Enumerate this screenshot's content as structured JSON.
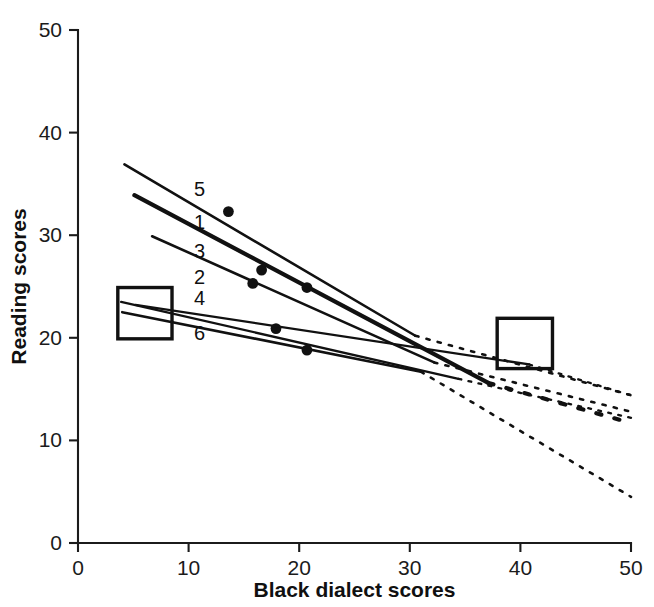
{
  "chart_data": {
    "type": "line",
    "title": "",
    "xlabel": "Black dialect scores",
    "ylabel": "Reading scores",
    "xlim": [
      0,
      50
    ],
    "ylim": [
      0,
      50
    ],
    "xticks": [
      0,
      10,
      20,
      30,
      40,
      50
    ],
    "yticks": [
      0,
      10,
      20,
      30,
      40,
      50
    ],
    "xtick_labels": [
      "0",
      "10",
      "20",
      "30",
      "40",
      "50"
    ],
    "ytick_labels": [
      "0",
      "10",
      "20",
      "30",
      "40",
      "50"
    ],
    "grid": false,
    "legend_position": "inline-labels",
    "annotations": [
      {
        "name": "left-highlight-box",
        "x0": 3.6,
        "y0": 19.9,
        "x1": 8.5,
        "y1": 24.9
      },
      {
        "name": "right-highlight-box",
        "x0": 37.9,
        "y0": 17.0,
        "x1": 42.9,
        "y1": 21.9
      }
    ],
    "series": [
      {
        "name": "5",
        "label": "5",
        "label_x": 11.0,
        "label_y": 34.5,
        "solid": {
          "x": [
            4.2,
            30.5
          ],
          "y": [
            36.9,
            20.2
          ]
        },
        "dotted": {
          "x": [
            30.5,
            50.0
          ],
          "y": [
            20.2,
            14.4
          ]
        },
        "points": [
          {
            "x": 13.6,
            "y": 32.3
          }
        ]
      },
      {
        "name": "1",
        "label": "1",
        "label_x": 11.0,
        "label_y": 31.3,
        "solid": {
          "x": [
            5.1,
            37.1
          ],
          "y": [
            33.9,
            15.6
          ]
        },
        "dotted": {
          "x": [
            37.1,
            50.0
          ],
          "y": [
            15.6,
            11.7
          ]
        },
        "points": [
          {
            "x": 16.6,
            "y": 26.6
          },
          {
            "x": 20.7,
            "y": 24.9
          }
        ]
      },
      {
        "name": "3",
        "label": "3",
        "label_x": 11.0,
        "label_y": 28.5,
        "solid": {
          "x": [
            6.7,
            32.2
          ],
          "y": [
            29.9,
            17.6
          ]
        },
        "dotted": {
          "x": [
            32.2,
            50.0
          ],
          "y": [
            17.6,
            12.8
          ]
        },
        "points": [
          {
            "x": 15.8,
            "y": 25.3
          }
        ]
      },
      {
        "name": "2",
        "label": "2",
        "label_x": 11.0,
        "label_y": 25.9,
        "solid": {
          "x": [
            3.9,
            34.4
          ],
          "y": [
            23.5,
            16.0
          ]
        },
        "dotted": {
          "x": [
            34.4,
            50.0
          ],
          "y": [
            16.0,
            12.2
          ]
        },
        "points": [
          {
            "x": 17.9,
            "y": 20.9
          }
        ]
      },
      {
        "name": "4",
        "label": "4",
        "label_x": 11.0,
        "label_y": 23.9,
        "solid": {
          "x": [
            5.2,
            40.8
          ],
          "y": [
            23.2,
            17.4
          ]
        },
        "dotted": {
          "x": [
            40.8,
            50.0
          ],
          "y": [
            17.4,
            14.4
          ]
        },
        "points": []
      },
      {
        "name": "6",
        "label": "6",
        "label_x": 11.0,
        "label_y": 20.5,
        "solid": {
          "x": [
            4.0,
            31.0
          ],
          "y": [
            22.5,
            16.7
          ]
        },
        "dotted": {
          "x": [
            31.0,
            50.0
          ],
          "y": [
            16.7,
            4.5
          ]
        },
        "points": [
          {
            "x": 20.7,
            "y": 18.8
          }
        ]
      }
    ]
  },
  "colors": {
    "ink": "#111111",
    "background": "#ffffff"
  }
}
